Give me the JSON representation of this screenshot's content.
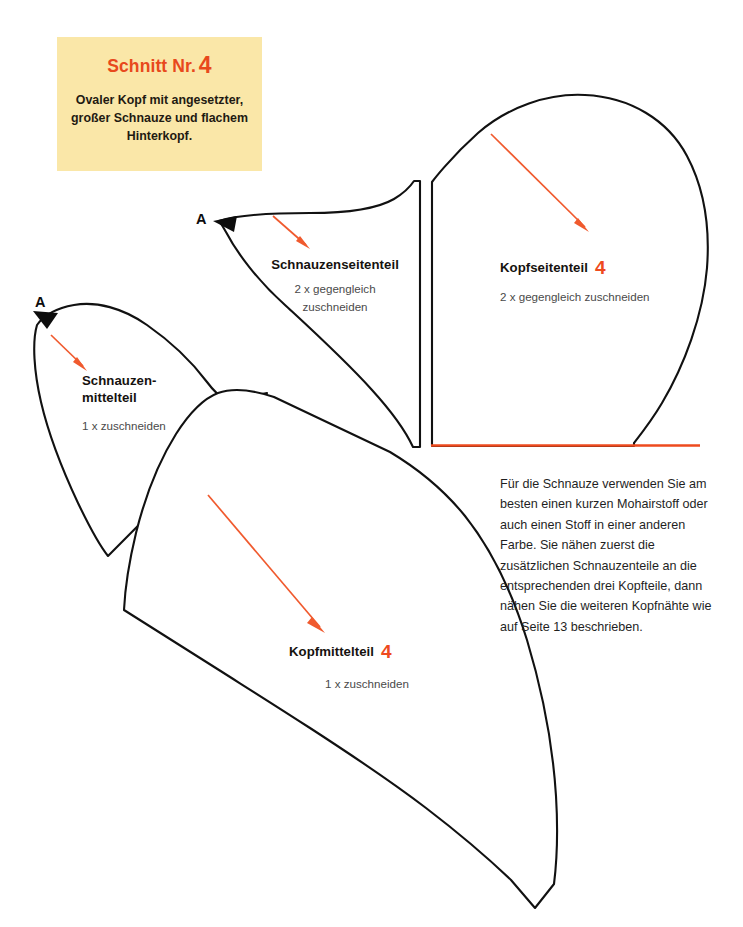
{
  "page": {
    "background_color": "#ffffff",
    "line_color": "#111111",
    "accent_color": "#EE4A1E",
    "box_color": "#FAE7A8"
  },
  "info_box": {
    "title_text": "Schnitt Nr.",
    "title_number": "4",
    "description": "Ovaler Kopf mit angesetzter,\ngroßer Schnauze\nund flachem Hinterkopf."
  },
  "markers": {
    "a_top": "A",
    "a_left": "A"
  },
  "pieces": [
    {
      "id": "schnauzenseitenteil",
      "name": "Schnauzenseitenteil",
      "number": "",
      "note": "2 x gegengleich\nzuschneiden"
    },
    {
      "id": "kopfseitenteil",
      "name": "Kopfseitenteil",
      "number": "4",
      "note": "2 x gegengleich zuschneiden"
    },
    {
      "id": "schnauzenmittelteil",
      "name": "Schnauzen-\nmittelteil",
      "number": "",
      "note": "1 x zuschneiden"
    },
    {
      "id": "kopfmittelteil",
      "name": "Kopfmittelteil",
      "number": "4",
      "note": "1 x zuschneiden"
    }
  ],
  "body_text": "Für die Schnauze verwenden Sie am besten einen kurzen Mohairstoff oder auch einen Stoff in einer anderen Farbe. Sie nähen zuerst die zusätzlichen Schnauzenteile an die entsprechenden drei Kopfteile, dann nähen Sie die weiteren Kopfnähte wie auf Seite 13 beschrieben."
}
